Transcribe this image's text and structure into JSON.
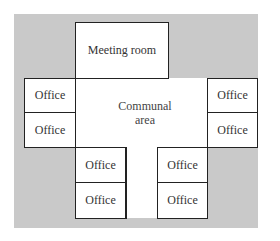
{
  "diagram": {
    "type": "floor plan",
    "rooms": {
      "meeting_room": "Meeting room",
      "communal_area_line1": "Communal",
      "communal_area_line2": "area",
      "office": "Office"
    },
    "offices": [
      {
        "id": "left-top",
        "label": "Office"
      },
      {
        "id": "left-bottom",
        "label": "Office"
      },
      {
        "id": "right-top",
        "label": "Office"
      },
      {
        "id": "right-bottom",
        "label": "Office"
      },
      {
        "id": "bottom-left-top",
        "label": "Office"
      },
      {
        "id": "bottom-left-bottom",
        "label": "Office"
      },
      {
        "id": "bottom-right-top",
        "label": "Office"
      },
      {
        "id": "bottom-right-bottom",
        "label": "Office"
      }
    ],
    "colors": {
      "background": "#c9c9c9",
      "rooms": "#ffffff",
      "walls": "#222222"
    }
  }
}
